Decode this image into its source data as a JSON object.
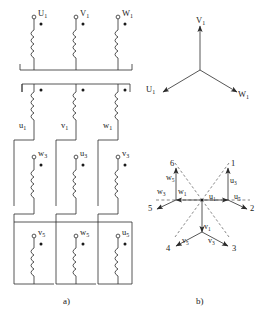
{
  "figure": {
    "captions": {
      "left": "a)",
      "right": "b)"
    }
  },
  "schematic": {
    "rows": [
      {
        "id": "row-primary",
        "terminals": [
          {
            "name": "U",
            "sub": "1"
          },
          {
            "name": "V",
            "sub": "1"
          },
          {
            "name": "W",
            "sub": "1"
          }
        ]
      },
      {
        "id": "row-sec-1",
        "terminals": [
          {
            "name": "u",
            "sub": "1"
          },
          {
            "name": "v",
            "sub": "1"
          },
          {
            "name": "w",
            "sub": "1"
          }
        ]
      },
      {
        "id": "row-sec-3",
        "terminals": [
          {
            "name": "w",
            "sub": "3"
          },
          {
            "name": "u",
            "sub": "3"
          },
          {
            "name": "v",
            "sub": "3"
          }
        ]
      },
      {
        "id": "row-sec-5",
        "terminals": [
          {
            "name": "v",
            "sub": "5"
          },
          {
            "name": "w",
            "sub": "5"
          },
          {
            "name": "u",
            "sub": "5"
          }
        ]
      }
    ]
  },
  "phasor_three_phase": {
    "title": "three-phase star",
    "vectors": [
      {
        "label": "V",
        "sub": "1",
        "angle_deg": 90
      },
      {
        "label": "U",
        "sub": "1",
        "angle_deg": 210
      },
      {
        "label": "W",
        "sub": "1",
        "angle_deg": 330
      }
    ]
  },
  "phasor_six_phase": {
    "title": "six-phase star",
    "terminals": [
      "1",
      "2",
      "3",
      "4",
      "5",
      "6"
    ],
    "vectors": [
      {
        "label": "u",
        "sub": "1",
        "angle_deg": 60
      },
      {
        "label": "u",
        "sub": "3",
        "angle_deg": 75
      },
      {
        "label": "u",
        "sub": "5",
        "angle_deg": 15
      },
      {
        "label": "w",
        "sub": "1",
        "angle_deg": 120
      },
      {
        "label": "w",
        "sub": "3",
        "angle_deg": 165
      },
      {
        "label": "w",
        "sub": "5",
        "angle_deg": 105
      },
      {
        "label": "v",
        "sub": "1",
        "angle_deg": 270
      },
      {
        "label": "v",
        "sub": "3",
        "angle_deg": 315
      },
      {
        "label": "v",
        "sub": "5",
        "angle_deg": 225
      }
    ],
    "axis": {
      "style": "dashed",
      "orientation": "horizontal"
    }
  },
  "colors": {
    "line": "#2b2b2b",
    "dash": "#555555",
    "text": "#1a1a1a"
  }
}
